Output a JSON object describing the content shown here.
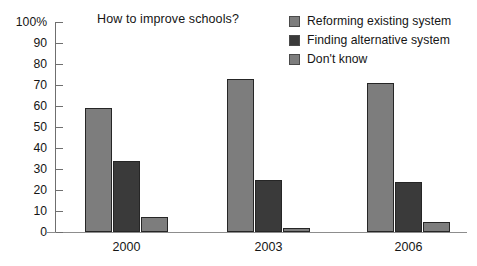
{
  "chart_data": {
    "type": "bar",
    "title": "How to improve schools?",
    "xlabel": "",
    "ylabel": "",
    "categories": [
      "2000",
      "2003",
      "2006"
    ],
    "series": [
      {
        "name": "Reforming existing system",
        "color": "#7d7d7d",
        "values": [
          59,
          73,
          71
        ]
      },
      {
        "name": "Finding alternative system",
        "color": "#3a3a3a",
        "values": [
          34,
          25,
          24
        ]
      },
      {
        "name": "Don't know",
        "color": "#7d7d7d",
        "values": [
          7,
          2,
          5
        ]
      }
    ],
    "ylim": [
      0,
      100
    ],
    "ytick_step": 10,
    "ytick_labels": [
      "100%",
      "90",
      "80",
      "70",
      "60",
      "50",
      "40",
      "30",
      "20",
      "10",
      "0"
    ],
    "ytick_values": [
      100,
      90,
      80,
      70,
      60,
      50,
      40,
      30,
      20,
      10,
      0
    ],
    "grid": false,
    "legend_position": "top-right",
    "bar_outline_color": "#262626"
  }
}
